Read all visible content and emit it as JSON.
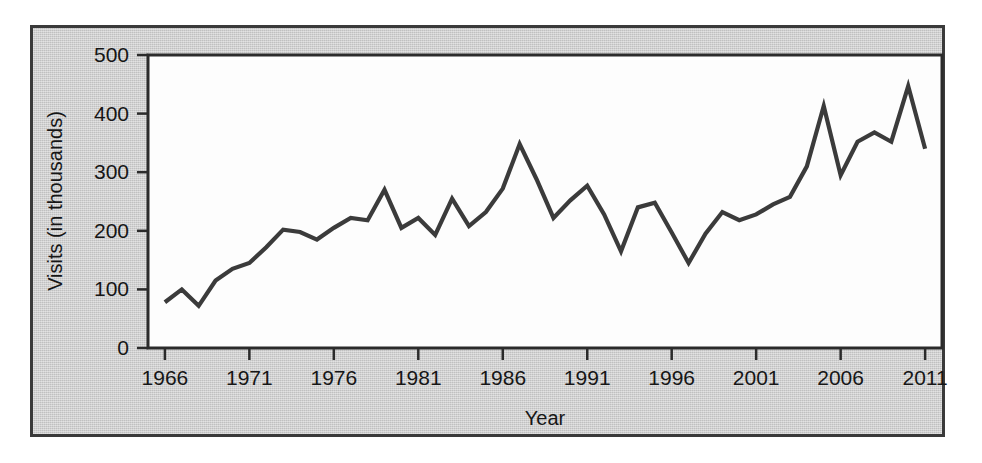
{
  "chart_data": {
    "type": "line",
    "title": "",
    "xlabel": "Year",
    "ylabel": "Visits (in thousands)",
    "xlim": [
      1965,
      2012
    ],
    "ylim": [
      0,
      500
    ],
    "grid": false,
    "legend": "none",
    "line_color": "#3b3b3b",
    "panel_background": "#c9c9c9",
    "plot_background": "#fdfdfd",
    "x_tick_labels": [
      "1966",
      "1971",
      "1976",
      "1981",
      "1986",
      "1991",
      "1996",
      "2001",
      "2006",
      "2011"
    ],
    "x_ticks": [
      1966,
      1971,
      1976,
      1981,
      1986,
      1991,
      1996,
      2001,
      2006,
      2011
    ],
    "y_tick_labels": [
      "0",
      "100",
      "200",
      "300",
      "400",
      "500"
    ],
    "y_ticks": [
      0,
      100,
      200,
      300,
      400,
      500
    ],
    "x": [
      1966,
      1967,
      1968,
      1969,
      1970,
      1971,
      1972,
      1973,
      1974,
      1975,
      1976,
      1977,
      1978,
      1979,
      1980,
      1981,
      1982,
      1983,
      1984,
      1985,
      1986,
      1987,
      1988,
      1989,
      1990,
      1991,
      1992,
      1993,
      1994,
      1995,
      1996,
      1997,
      1998,
      1999,
      2000,
      2001,
      2002,
      2003,
      2004,
      2005,
      2006,
      2007,
      2008,
      2009,
      2010,
      2011
    ],
    "values": [
      78,
      100,
      72,
      115,
      135,
      145,
      172,
      202,
      198,
      185,
      205,
      222,
      218,
      270,
      205,
      222,
      193,
      255,
      208,
      232,
      272,
      348,
      288,
      222,
      252,
      277,
      228,
      165,
      240,
      248,
      197,
      145,
      195,
      232,
      218,
      228,
      245,
      258,
      310,
      413,
      295,
      352,
      368,
      352,
      447,
      340
    ],
    "series_name": "Visits"
  }
}
